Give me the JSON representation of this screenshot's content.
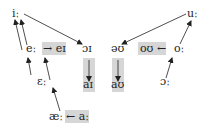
{
  "diagram": {
    "nodes": [
      {
        "id": "i_long",
        "label": "iː"
      },
      {
        "id": "u_long",
        "label": "uː"
      },
      {
        "id": "e_long",
        "label": "eː"
      },
      {
        "id": "ei",
        "label": "→ eɪ"
      },
      {
        "id": "oi",
        "label": "ɔɪ"
      },
      {
        "id": "ai",
        "label": "aɪ"
      },
      {
        "id": "ou_schwa",
        "label": "əʊ"
      },
      {
        "id": "au",
        "label": "aʊ"
      },
      {
        "id": "ou",
        "label": "oʊ ←"
      },
      {
        "id": "o_long",
        "label": "oː"
      },
      {
        "id": "eps_long",
        "label": "ɛː"
      },
      {
        "id": "open_o_long",
        "label": "ɔː"
      },
      {
        "id": "ae_long",
        "label": "æː"
      },
      {
        "id": "a_long",
        "label": "← aː"
      }
    ],
    "edges": [
      {
        "from": "e_long",
        "to": "i_long"
      },
      {
        "from": "eps_long",
        "to": "i_long"
      },
      {
        "from": "i_long",
        "to": "oi"
      },
      {
        "from": "u_long",
        "to": "ou_schwa"
      },
      {
        "from": "o_long",
        "to": "u_long"
      },
      {
        "from": "open_o_long",
        "to": "ou"
      },
      {
        "from": "eps_long",
        "to": "e_long"
      },
      {
        "from": "ae_long",
        "to": "eps_long"
      },
      {
        "from": "oi",
        "to": "ai"
      },
      {
        "from": "ou_schwa",
        "to": "au"
      }
    ],
    "colors": {
      "highlight_box": "#d6d6d6",
      "ink": "#222222"
    }
  }
}
